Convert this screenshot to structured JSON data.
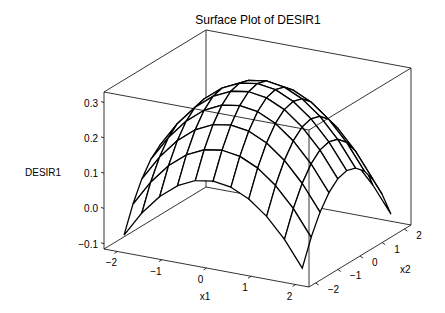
{
  "chart_data": {
    "type": "surface",
    "title": "Surface Plot of DESIR1",
    "xlabel": "x1",
    "ylabel": "x2",
    "zlabel": "DESIR1",
    "x_ticks": [
      "-2",
      "-1",
      "0",
      "1",
      "2"
    ],
    "y_ticks": [
      "-2",
      "-1",
      "0",
      "1",
      "2"
    ],
    "z_ticks": [
      "-0.1",
      "0.0",
      "0.1",
      "0.2",
      "0.3"
    ],
    "x_range": [
      -2.3,
      2.3
    ],
    "y_range": [
      -2.3,
      2.3
    ],
    "z_range": [
      -0.115,
      0.33
    ],
    "grid": {
      "x": [
        -2,
        -1.6,
        -1.2,
        -0.8,
        -0.4,
        0,
        0.4,
        0.8,
        1.2,
        1.6,
        2
      ],
      "y": [
        -2,
        -1.6,
        -1.2,
        -0.8,
        -0.4,
        0,
        0.4,
        0.8,
        1.2,
        1.6,
        2
      ]
    },
    "surface_model": {
      "peak": 0.32,
      "curvature": 0.05,
      "description": "dome-shaped surface with maximum ~0.32 at x1=0,x2=0 decreasing to about -0.08 at corners"
    }
  },
  "colors": {
    "line": "#000000",
    "background": "#ffffff"
  }
}
